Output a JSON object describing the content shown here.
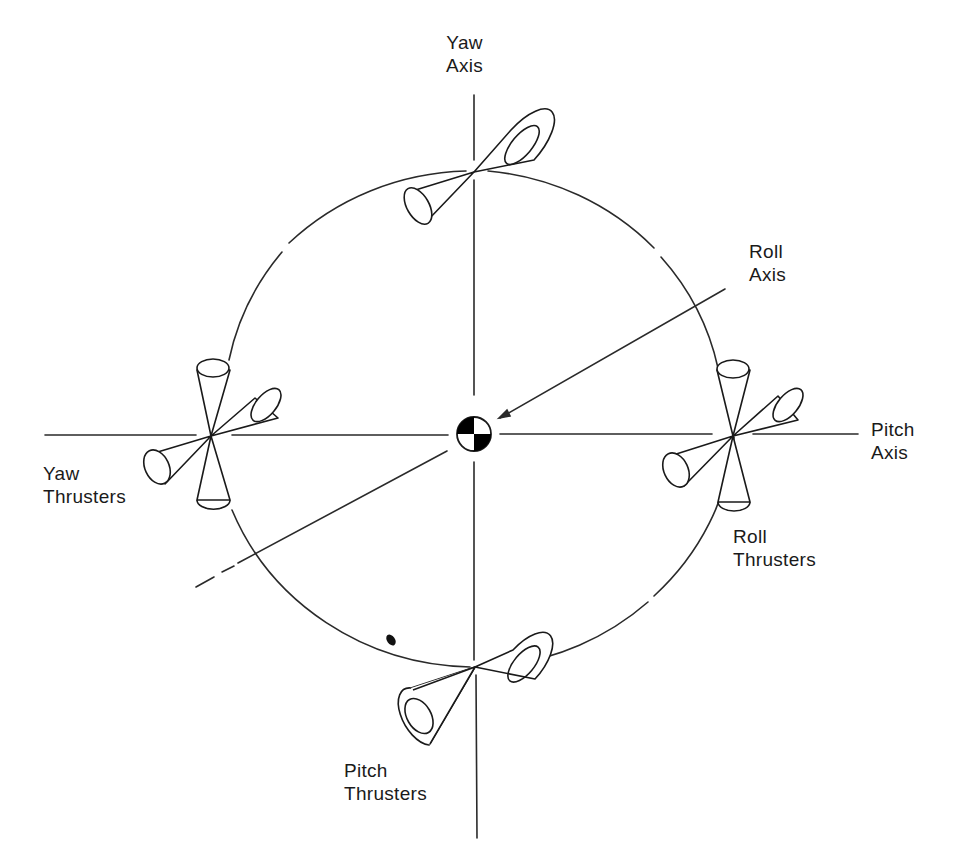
{
  "diagram": {
    "labels": {
      "yaw_axis": {
        "line1": "Yaw",
        "line2": "Axis"
      },
      "roll_axis": {
        "line1": "Roll",
        "line2": "Axis"
      },
      "pitch_axis": {
        "line1": "Pitch",
        "line2": "Axis"
      },
      "yaw_thrusters": {
        "line1": "Yaw",
        "line2": "Thrusters"
      },
      "roll_thrusters": {
        "line1": "Roll",
        "line2": "Thrusters"
      },
      "pitch_thrusters": {
        "line1": "Pitch",
        "line2": "Thrusters"
      }
    },
    "colors": {
      "line": "#2a2a2a",
      "fill": "#000000",
      "background": "#ffffff"
    },
    "center_of_mass_symbol": "quartered-circle"
  }
}
